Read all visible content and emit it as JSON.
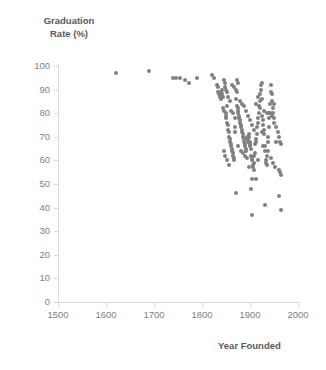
{
  "chart_data": {
    "type": "scatter",
    "title": "",
    "xlabel": "Year Founded",
    "ylabel": "Graduation\nRate (%)",
    "xlim": [
      1500,
      2000
    ],
    "ylim": [
      0,
      100
    ],
    "xticks": [
      1500,
      1600,
      1700,
      1800,
      1900,
      2000
    ],
    "yticks": [
      0,
      10,
      20,
      30,
      40,
      50,
      60,
      70,
      80,
      90,
      100
    ],
    "grid": false,
    "legend": "none",
    "marker_color": "#808080",
    "marker_size": 4,
    "series": [
      {
        "name": "Colleges",
        "points": [
          [
            1620,
            97
          ],
          [
            1690,
            98
          ],
          [
            1740,
            95
          ],
          [
            1746,
            95
          ],
          [
            1755,
            95
          ],
          [
            1764,
            94
          ],
          [
            1773,
            93
          ],
          [
            1789,
            95
          ],
          [
            1821,
            96
          ],
          [
            1826,
            95
          ],
          [
            1831,
            92
          ],
          [
            1833,
            91
          ],
          [
            1834,
            89
          ],
          [
            1836,
            88
          ],
          [
            1837,
            88
          ],
          [
            1838,
            87
          ],
          [
            1839,
            89
          ],
          [
            1840,
            86
          ],
          [
            1841,
            90
          ],
          [
            1842,
            88
          ],
          [
            1843,
            87
          ],
          [
            1844,
            82
          ],
          [
            1845,
            81
          ],
          [
            1846,
            94
          ],
          [
            1847,
            93
          ],
          [
            1848,
            91
          ],
          [
            1849,
            80
          ],
          [
            1850,
            79
          ],
          [
            1851,
            78
          ],
          [
            1852,
            83
          ],
          [
            1853,
            76
          ],
          [
            1854,
            75
          ],
          [
            1855,
            73
          ],
          [
            1856,
            72
          ],
          [
            1857,
            70
          ],
          [
            1858,
            69
          ],
          [
            1859,
            68
          ],
          [
            1860,
            67
          ],
          [
            1861,
            66
          ],
          [
            1862,
            65
          ],
          [
            1863,
            64
          ],
          [
            1864,
            63
          ],
          [
            1865,
            62
          ],
          [
            1866,
            61
          ],
          [
            1867,
            60
          ],
          [
            1868,
            72
          ],
          [
            1869,
            74
          ],
          [
            1870,
            86
          ],
          [
            1871,
            90
          ],
          [
            1872,
            89
          ],
          [
            1873,
            83
          ],
          [
            1874,
            82
          ],
          [
            1875,
            81
          ],
          [
            1876,
            80
          ],
          [
            1877,
            79
          ],
          [
            1878,
            78
          ],
          [
            1879,
            77
          ],
          [
            1880,
            76
          ],
          [
            1881,
            75
          ],
          [
            1882,
            74
          ],
          [
            1883,
            73
          ],
          [
            1884,
            72
          ],
          [
            1885,
            71
          ],
          [
            1886,
            70
          ],
          [
            1887,
            69
          ],
          [
            1888,
            68
          ],
          [
            1889,
            67
          ],
          [
            1890,
            66
          ],
          [
            1891,
            65
          ],
          [
            1892,
            64
          ],
          [
            1893,
            70
          ],
          [
            1894,
            69
          ],
          [
            1895,
            68
          ],
          [
            1896,
            69
          ],
          [
            1897,
            70
          ],
          [
            1898,
            71
          ],
          [
            1899,
            68
          ],
          [
            1900,
            67
          ],
          [
            1901,
            66
          ],
          [
            1902,
            65
          ],
          [
            1903,
            62
          ],
          [
            1904,
            61
          ],
          [
            1905,
            60
          ],
          [
            1906,
            58
          ],
          [
            1907,
            57
          ],
          [
            1908,
            56
          ],
          [
            1909,
            59
          ],
          [
            1910,
            63
          ],
          [
            1911,
            67
          ],
          [
            1912,
            68
          ],
          [
            1913,
            69
          ],
          [
            1914,
            71
          ],
          [
            1915,
            74
          ],
          [
            1916,
            76
          ],
          [
            1917,
            78
          ],
          [
            1918,
            80
          ],
          [
            1919,
            83
          ],
          [
            1920,
            85
          ],
          [
            1921,
            88
          ],
          [
            1922,
            90
          ],
          [
            1923,
            92
          ],
          [
            1924,
            93
          ],
          [
            1925,
            86
          ],
          [
            1926,
            79
          ],
          [
            1927,
            77
          ],
          [
            1928,
            75
          ],
          [
            1929,
            73
          ],
          [
            1930,
            71
          ],
          [
            1931,
            66
          ],
          [
            1932,
            64
          ],
          [
            1933,
            60
          ],
          [
            1934,
            59
          ],
          [
            1935,
            58
          ],
          [
            1936,
            62
          ],
          [
            1937,
            68
          ],
          [
            1938,
            70
          ],
          [
            1939,
            74
          ],
          [
            1940,
            78
          ],
          [
            1941,
            80
          ],
          [
            1942,
            84
          ],
          [
            1943,
            89
          ],
          [
            1944,
            92
          ],
          [
            1945,
            88
          ],
          [
            1946,
            85
          ],
          [
            1947,
            82
          ],
          [
            1948,
            80
          ],
          [
            1949,
            78
          ],
          [
            1950,
            76
          ],
          [
            1955,
            74
          ],
          [
            1958,
            72
          ],
          [
            1960,
            70
          ],
          [
            1962,
            68
          ],
          [
            1965,
            67
          ],
          [
            1850,
            90
          ],
          [
            1852,
            89
          ],
          [
            1855,
            87
          ],
          [
            1858,
            85
          ],
          [
            1862,
            92
          ],
          [
            1866,
            91
          ],
          [
            1872,
            94
          ],
          [
            1876,
            93
          ],
          [
            1880,
            85
          ],
          [
            1884,
            84
          ],
          [
            1888,
            83
          ],
          [
            1892,
            81
          ],
          [
            1896,
            79
          ],
          [
            1900,
            77
          ],
          [
            1904,
            75
          ],
          [
            1908,
            73
          ],
          [
            1912,
            84
          ],
          [
            1916,
            87
          ],
          [
            1920,
            82
          ],
          [
            1930,
            81
          ],
          [
            1935,
            80
          ],
          [
            1940,
            80
          ],
          [
            1945,
            79
          ],
          [
            1950,
            84
          ],
          [
            1955,
            68
          ],
          [
            1960,
            56
          ],
          [
            1962,
            55
          ],
          [
            1964,
            54
          ],
          [
            1905,
            52
          ],
          [
            1912,
            52
          ],
          [
            1870,
            46
          ],
          [
            1902,
            48
          ],
          [
            1905,
            37
          ],
          [
            1932,
            41
          ],
          [
            1960,
            45
          ],
          [
            1965,
            39
          ],
          [
            1845,
            64
          ],
          [
            1848,
            62
          ],
          [
            1852,
            60
          ],
          [
            1856,
            58
          ],
          [
            1860,
            81
          ],
          [
            1864,
            80
          ],
          [
            1868,
            78
          ],
          [
            1876,
            66
          ],
          [
            1882,
            64
          ],
          [
            1886,
            63
          ],
          [
            1890,
            62
          ],
          [
            1894,
            61
          ],
          [
            1898,
            57
          ],
          [
            1908,
            62
          ],
          [
            1916,
            60
          ],
          [
            1924,
            72
          ],
          [
            1928,
            66
          ],
          [
            1938,
            64
          ],
          [
            1944,
            61
          ],
          [
            1948,
            59
          ],
          [
            1952,
            57
          ]
        ]
      }
    ]
  }
}
